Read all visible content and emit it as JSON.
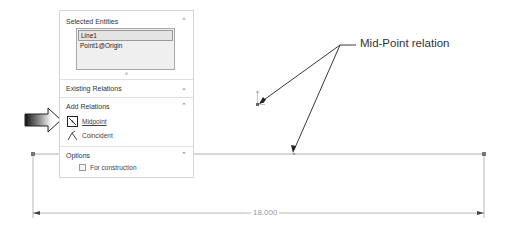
{
  "property_manager": {
    "selected_entities": {
      "title": "Selected Entities",
      "chevron": "chevron-up",
      "items": [
        "Line1",
        "Point1@Origin"
      ],
      "selected_index": 0
    },
    "existing_relations": {
      "title": "Existing Relations",
      "chevron": "chevron-down"
    },
    "add_relations": {
      "title": "Add Relations",
      "chevron": "chevron-up",
      "options": [
        {
          "label": "Midpoint",
          "icon": "midpoint-icon",
          "active": true
        },
        {
          "label": "Coincident",
          "icon": "coincident-icon",
          "active": false
        }
      ]
    },
    "options": {
      "title": "Options",
      "chevron": "chevron-up",
      "for_construction_label": "For construction",
      "for_construction_checked": false
    }
  },
  "sketch": {
    "dimension_value": "18.000",
    "line_color": "#8a8a8a",
    "point_color": "#777777"
  },
  "annotation": {
    "callout_text": "Mid-Point relation"
  }
}
